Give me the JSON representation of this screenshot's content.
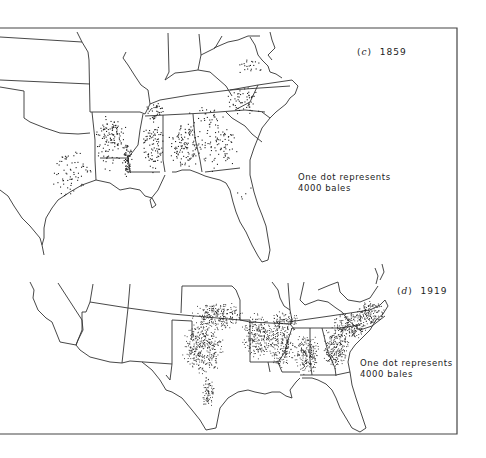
{
  "figure": {
    "type": "dot-distribution maps of cotton production, southern United States",
    "panels": [
      {
        "id": "c",
        "label_letter": "c",
        "year": "1859",
        "legend_line1": "One dot represents",
        "legend_line2": "4000 bales",
        "dot_color": "#222222"
      },
      {
        "id": "d",
        "label_letter": "d",
        "year": "1919",
        "legend_line1": "One dot represents",
        "legend_line2": "4000 bales",
        "dot_color": "#222222"
      }
    ],
    "clusters": {
      "c": [
        {
          "x": [
            92,
            128
          ],
          "y": [
            118,
            148
          ],
          "n": 55,
          "region": "east Texas"
        },
        {
          "x": [
            45,
            95
          ],
          "y": [
            145,
            200
          ],
          "n": 70,
          "region": "south-east Texas"
        },
        {
          "x": [
            92,
            128
          ],
          "y": [
            110,
            175
          ],
          "n": 70,
          "region": "Louisiana/Arkansas"
        },
        {
          "x": [
            122,
            132
          ],
          "y": [
            140,
            180
          ],
          "n": 70,
          "region": "Mississippi river delta"
        },
        {
          "x": [
            140,
            165
          ],
          "y": [
            115,
            175
          ],
          "n": 90,
          "region": "Mississippi"
        },
        {
          "x": [
            145,
            165
          ],
          "y": [
            100,
            120
          ],
          "n": 35,
          "region": "west Tennessee"
        },
        {
          "x": [
            165,
            205
          ],
          "y": [
            118,
            170
          ],
          "n": 120,
          "region": "Alabama black belt"
        },
        {
          "x": [
            195,
            240
          ],
          "y": [
            110,
            175
          ],
          "n": 90,
          "region": "Georgia"
        },
        {
          "x": [
            225,
            262
          ],
          "y": [
            85,
            120
          ],
          "n": 55,
          "region": "South Carolina"
        },
        {
          "x": [
            232,
            268
          ],
          "y": [
            57,
            75
          ],
          "n": 22,
          "region": "North Carolina"
        },
        {
          "x": [
            185,
            225
          ],
          "y": [
            105,
            125
          ],
          "n": 20,
          "region": "north Alabama"
        },
        {
          "x": [
            235,
            260
          ],
          "y": [
            185,
            205
          ],
          "n": 5,
          "region": "north Florida"
        }
      ],
      "d": [
        {
          "x": [
            180,
            225
          ],
          "y": [
            320,
            375
          ],
          "n": 360,
          "region": "central Texas"
        },
        {
          "x": [
            190,
            245
          ],
          "y": [
            300,
            330
          ],
          "n": 240,
          "region": "Oklahoma"
        },
        {
          "x": [
            200,
            215
          ],
          "y": [
            375,
            410
          ],
          "n": 80,
          "region": "south Texas"
        },
        {
          "x": [
            240,
            275
          ],
          "y": [
            310,
            360
          ],
          "n": 240,
          "region": "Arkansas/Louisiana"
        },
        {
          "x": [
            265,
            295
          ],
          "y": [
            320,
            370
          ],
          "n": 200,
          "region": "Mississippi"
        },
        {
          "x": [
            293,
            320
          ],
          "y": [
            330,
            375
          ],
          "n": 200,
          "region": "Alabama"
        },
        {
          "x": [
            320,
            350
          ],
          "y": [
            325,
            370
          ],
          "n": 220,
          "region": "Georgia"
        },
        {
          "x": [
            330,
            370
          ],
          "y": [
            310,
            340
          ],
          "n": 200,
          "region": "South Carolina"
        },
        {
          "x": [
            355,
            385
          ],
          "y": [
            300,
            325
          ],
          "n": 150,
          "region": "North Carolina"
        },
        {
          "x": [
            268,
            300
          ],
          "y": [
            310,
            332
          ],
          "n": 100,
          "region": "west Tennessee"
        }
      ]
    }
  }
}
